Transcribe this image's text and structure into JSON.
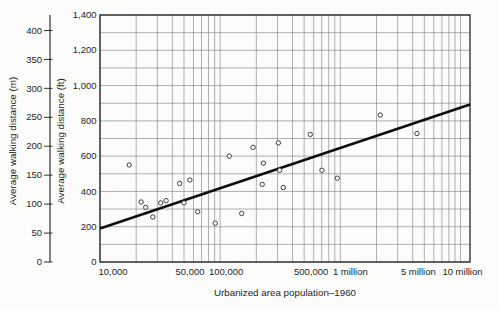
{
  "chart_data": {
    "type": "scatter",
    "title": "",
    "xlabel": "Urbanized area population–1960",
    "ylabel_outer": "Average walking distance (m)",
    "ylabel_inner": "Average walking distance (ft)",
    "x_scale": "log",
    "xlim": [
      10000,
      12000000
    ],
    "ylim_ft": [
      0,
      1400
    ],
    "ylim_m": [
      0,
      400
    ],
    "grid": true,
    "grid_step_ft": 100,
    "x_ticks": [
      {
        "value": 10000,
        "label": "10,000",
        "dx": 13
      },
      {
        "value": 50000,
        "label": "50,000",
        "dx": 6
      },
      {
        "value": 100000,
        "label": "100,000",
        "dx": 6
      },
      {
        "value": 500000,
        "label": "500,000",
        "dx": 7
      },
      {
        "value": 1000000,
        "label": "1 million",
        "dx": 10
      },
      {
        "value": 5000000,
        "label": "5 million",
        "dx": -6
      },
      {
        "value": 10000000,
        "label": "10 million",
        "dx": 2
      }
    ],
    "y_ticks_ft": [
      {
        "value": 0,
        "label": "0"
      },
      {
        "value": 200,
        "label": "200"
      },
      {
        "value": 400,
        "label": "400"
      },
      {
        "value": 600,
        "label": "600"
      },
      {
        "value": 800,
        "label": "800"
      },
      {
        "value": 1000,
        "label": "1,000"
      },
      {
        "value": 1200,
        "label": "1,200"
      },
      {
        "value": 1400,
        "label": "1,400"
      }
    ],
    "y_ticks_m": [
      {
        "value": 0,
        "label": "0"
      },
      {
        "value": 50,
        "label": "50"
      },
      {
        "value": 100,
        "label": "100"
      },
      {
        "value": 150,
        "label": "150"
      },
      {
        "value": 200,
        "label": "200"
      },
      {
        "value": 250,
        "label": "250"
      },
      {
        "value": 300,
        "label": "300"
      },
      {
        "value": 350,
        "label": "350"
      },
      {
        "value": 400,
        "label": "400"
      }
    ],
    "points_format": [
      "population_1960",
      "avg_walking_distance_ft"
    ],
    "points": [
      [
        17500,
        550
      ],
      [
        22000,
        340
      ],
      [
        24000,
        310
      ],
      [
        27500,
        255
      ],
      [
        32000,
        335
      ],
      [
        35500,
        348
      ],
      [
        46000,
        445
      ],
      [
        50000,
        335
      ],
      [
        56000,
        465
      ],
      [
        65000,
        285
      ],
      [
        91000,
        220
      ],
      [
        119000,
        600
      ],
      [
        151000,
        275
      ],
      [
        188000,
        650
      ],
      [
        224000,
        440
      ],
      [
        229000,
        560
      ],
      [
        305000,
        675
      ],
      [
        313000,
        520
      ],
      [
        335000,
        422
      ],
      [
        562000,
        723
      ],
      [
        703000,
        520
      ],
      [
        944000,
        475
      ],
      [
        2150000,
        833
      ],
      [
        4340000,
        728
      ]
    ],
    "trend_line": {
      "from": {
        "population": 10000,
        "walk_ft": 190
      },
      "to": {
        "population": 12000000,
        "walk_ft": 893
      }
    },
    "colors": {
      "grid": "#858585",
      "border": "#1c1c1c",
      "trend": "#0e0e0e",
      "marker_stroke": "#2e2e2e",
      "marker_fill": "#fcfcfa",
      "text": "#1f1f1f",
      "background": "#fcfcfa"
    },
    "meters_per_foot": 0.3048
  }
}
